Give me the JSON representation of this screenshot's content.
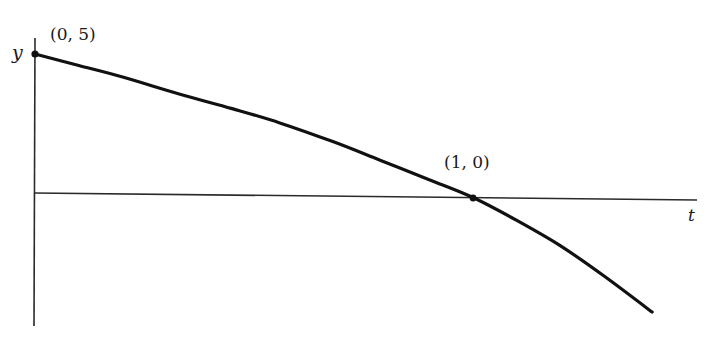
{
  "chart_data": {
    "type": "line",
    "title": "",
    "xlabel": "t",
    "ylabel": "y",
    "grid": false,
    "legend": null,
    "series": [
      {
        "name": "y(t)",
        "points": [
          {
            "t": 0.0,
            "y": 5.0
          },
          {
            "t": 0.1,
            "y": 4.6
          },
          {
            "t": 0.2,
            "y": 4.2
          },
          {
            "t": 0.331,
            "y": 3.6
          },
          {
            "t": 0.45,
            "y": 3.1
          },
          {
            "t": 0.559,
            "y": 2.6
          },
          {
            "t": 0.68,
            "y": 1.95
          },
          {
            "t": 0.788,
            "y": 1.3
          },
          {
            "t": 0.9,
            "y": 0.62
          },
          {
            "t": 1.0,
            "y": 0.0
          },
          {
            "t": 1.1,
            "y": -0.8
          },
          {
            "t": 1.199,
            "y": -1.68
          },
          {
            "t": 1.3,
            "y": -2.75
          },
          {
            "t": 1.409,
            "y": -4.0
          }
        ]
      }
    ],
    "annotations": [
      {
        "label": "(0, 5)",
        "t": 0,
        "y": 5,
        "marked_point": true
      },
      {
        "label": "(1, 0)",
        "t": 1,
        "y": 0,
        "marked_point": true
      }
    ],
    "xlim": [
      0,
      1.5
    ],
    "ylim": [
      -4.5,
      5.5
    ]
  },
  "labels": {
    "y_axis": "y",
    "t_axis": "t",
    "point_start": "(0, 5)",
    "point_root": "(1, 0)"
  }
}
